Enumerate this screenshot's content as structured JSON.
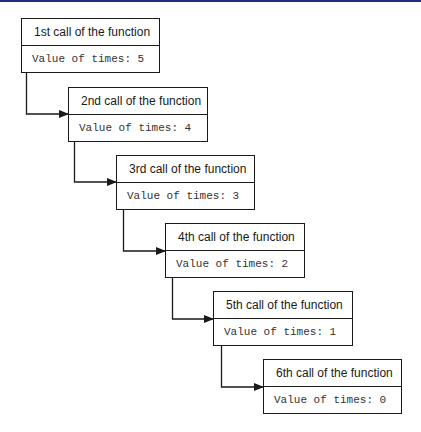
{
  "diagram": {
    "calls": [
      {
        "title": "1st call of the function",
        "value": "Value of times: 5"
      },
      {
        "title": "2nd call of the function",
        "value": "Value of times: 4"
      },
      {
        "title": "3rd call of the function",
        "value": "Value of times: 3"
      },
      {
        "title": "4th call of the function",
        "value": "Value of times: 2"
      },
      {
        "title": "5th call of the function",
        "value": "Value of times: 1"
      },
      {
        "title": "6th call of the function",
        "value": "Value of times: 0"
      }
    ],
    "colors": {
      "top_bar": "#1f2a80",
      "stroke": "#1a1a1a",
      "background": "#ffffff"
    }
  }
}
